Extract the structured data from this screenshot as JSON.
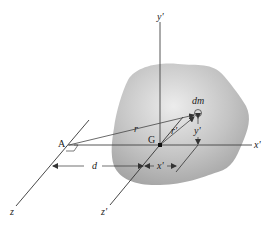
{
  "figure": {
    "colors": {
      "line": "#333333",
      "blob_light": "#e8e8e8",
      "blob_dark": "#a9a9a9",
      "background": "#ffffff"
    },
    "labels": {
      "y_prime_axis": "y'",
      "x_prime_axis": "x'",
      "z_axis": "z",
      "z_prime_axis": "z'",
      "point_A": "A",
      "point_G": "G",
      "mass_element": "dm",
      "vector_r": "r",
      "vector_r_prime": "r'",
      "dim_d": "d",
      "dim_x_prime": "x'",
      "dim_y_prime": "y'"
    }
  }
}
